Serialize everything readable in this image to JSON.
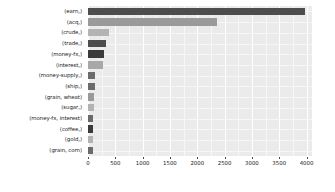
{
  "chart_data": {
    "type": "bar",
    "orientation": "horizontal",
    "title": "",
    "subtitle": "",
    "xlabel": "",
    "ylabel": "",
    "xlim": [
      0,
      4100
    ],
    "grid": true,
    "legend": null,
    "theme": "grey-panel-white-gridlines",
    "categories": [
      "(earn,)",
      "(acq,)",
      "(crude,)",
      "(trade,)",
      "(money-fx,)",
      "(interest,)",
      "(money-supply,)",
      "(ship,)",
      "(grain, wheat)",
      "(sugar,)",
      "(money-fx, interest)",
      "(coffee,)",
      "(gold,)",
      "(grain, corn)"
    ],
    "values": [
      3964,
      2369,
      388,
      326,
      293,
      271,
      132,
      136,
      109,
      102,
      95,
      90,
      90,
      88
    ],
    "bar_colors": [
      "#4d4d4d",
      "#9a9a9a",
      "#b3b3b3",
      "#4d4d4d",
      "#3b3b3b",
      "#a8a8a8",
      "#6b6b6b",
      "#6b6b6b",
      "#9a9a9a",
      "#b3b3b3",
      "#6b6b6b",
      "#3b3b3b",
      "#b3b3b3",
      "#6b6b6b"
    ],
    "xticks": [
      0,
      500,
      1000,
      1500,
      2000,
      2500,
      3000,
      3500,
      4000
    ],
    "xtick_labels": [
      "0",
      "500",
      "1000",
      "1500",
      "2000",
      "2500",
      "3000",
      "3500",
      "4000"
    ],
    "panel_background": "#ebebeb",
    "gridline_color": "#ffffff",
    "page_background": "#ffffff"
  }
}
